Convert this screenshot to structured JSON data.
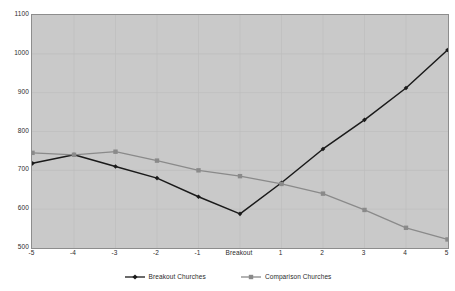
{
  "chart_data": {
    "type": "line",
    "title": "",
    "xlabel": "",
    "ylabel": "",
    "categories": [
      "-5",
      "-4",
      "-3",
      "-2",
      "-1",
      "Breakout",
      "1",
      "2",
      "3",
      "4",
      "5"
    ],
    "ylim": [
      500,
      1100
    ],
    "ytick_step": 100,
    "yticks": [
      "1100",
      "1000",
      "900",
      "800",
      "700",
      "600",
      "500"
    ],
    "grid": true,
    "legend_position": "bottom",
    "series": [
      {
        "name": "Breakout Churches",
        "color": "#1a1a1a",
        "marker": "diamond",
        "values": [
          718,
          740,
          710,
          680,
          632,
          588,
          668,
          755,
          830,
          912,
          1010
        ]
      },
      {
        "name": "Comparison Churches",
        "color": "#8a8a8a",
        "marker": "square",
        "values": [
          745,
          740,
          748,
          725,
          700,
          685,
          665,
          640,
          598,
          552,
          522
        ]
      }
    ]
  },
  "legend": {
    "entries": [
      {
        "label": "Breakout Churches"
      },
      {
        "label": "Comparison Churches"
      }
    ]
  },
  "colors": {
    "plot_background": "#c9c9c9",
    "page_background": "#ffffff",
    "axis_text": "#2b2b2b",
    "frame": "#8d8d8d",
    "gridline": "#bdbdbd"
  }
}
